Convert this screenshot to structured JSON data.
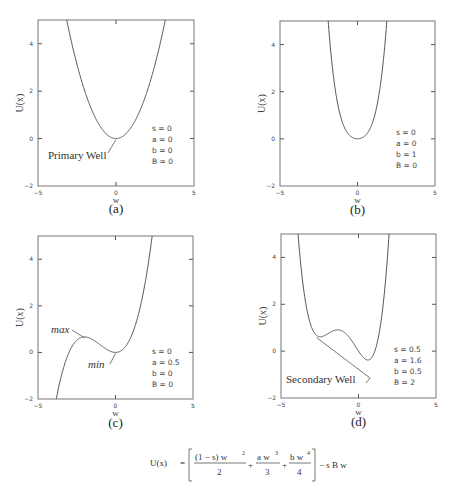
{
  "chart_data": [
    {
      "type": "line",
      "panel_label": "(a)",
      "xlabel": "w",
      "ylabel": "U(x)",
      "xlim": [
        -5,
        5
      ],
      "ylim": [
        -2,
        5
      ],
      "x_ticks": [
        "-5",
        "0",
        "5"
      ],
      "y_ticks": [
        "-2",
        "0",
        "2",
        "4"
      ],
      "params": [
        "s = 0",
        "a = 0",
        "b = 0",
        "B = 0"
      ],
      "param_values": {
        "s": 0,
        "a": 0,
        "b": 0,
        "B": 0
      },
      "annotations": [
        {
          "text": "Primary Well",
          "style": "normal",
          "points_to": [
            0,
            0
          ]
        }
      ],
      "series": [
        {
          "name": "U(w)",
          "x": [
            -3.16,
            -3,
            -2.5,
            -2,
            -1.5,
            -1,
            -0.5,
            0,
            0.5,
            1,
            1.5,
            2,
            2.5,
            3,
            3.16
          ],
          "y": [
            5.0,
            4.5,
            3.125,
            2.0,
            1.125,
            0.5,
            0.125,
            0,
            0.125,
            0.5,
            1.125,
            2.0,
            3.125,
            4.5,
            5.0
          ]
        }
      ]
    },
    {
      "type": "line",
      "panel_label": "(b)",
      "xlabel": "w",
      "ylabel": "U(x)",
      "xlim": [
        -5,
        5
      ],
      "ylim": [
        -2,
        5
      ],
      "x_ticks": [
        "-5",
        "0",
        "5"
      ],
      "y_ticks": [
        "-2",
        "0",
        "2",
        "4"
      ],
      "params": [
        "s = 0",
        "a = 0",
        "b = 1",
        "B = 0"
      ],
      "param_values": {
        "s": 0,
        "a": 0,
        "b": 1,
        "B": 0
      },
      "annotations": [],
      "series": [
        {
          "name": "U(w)",
          "x": [
            -1.85,
            -1.5,
            -1,
            -0.5,
            0,
            0.5,
            1,
            1.5,
            1.85
          ],
          "y": [
            5.0,
            2.39,
            0.75,
            0.14,
            0,
            0.14,
            0.75,
            2.39,
            5.0
          ]
        }
      ]
    },
    {
      "type": "line",
      "panel_label": "(c)",
      "xlabel": "w",
      "ylabel": "U(x)",
      "xlim": [
        -5,
        5
      ],
      "ylim": [
        -2,
        5
      ],
      "x_ticks": [
        "-5",
        "0",
        "5"
      ],
      "y_ticks": [
        "-2",
        "0",
        "2",
        "4"
      ],
      "params": [
        "s = 0",
        "a = 0.5",
        "b = 0",
        "B = 0"
      ],
      "param_values": {
        "s": 0,
        "a": 0.5,
        "b": 0,
        "B": 0
      },
      "annotations": [
        {
          "text": "max",
          "style": "italic",
          "points_to": [
            -2,
            0.67
          ]
        },
        {
          "text": "min",
          "style": "italic",
          "points_to": [
            0,
            0
          ]
        }
      ],
      "series": [
        {
          "name": "U(w)",
          "x": [
            -4.1,
            -3.5,
            -3,
            -2.5,
            -2,
            -1.5,
            -1,
            -0.5,
            0,
            0.5,
            1,
            1.5,
            2,
            2.5,
            2.65
          ],
          "y": [
            -3.08,
            -1.02,
            0,
            0.52,
            0.67,
            0.56,
            0.33,
            0.1,
            0,
            0.15,
            0.67,
            1.69,
            3.33,
            5.73,
            5.0
          ]
        }
      ]
    },
    {
      "type": "line",
      "panel_label": "(d)",
      "xlabel": "w",
      "ylabel": "U(x)",
      "xlim": [
        -5,
        5
      ],
      "ylim": [
        -2,
        5
      ],
      "x_ticks": [
        "-5",
        "0",
        "5"
      ],
      "y_ticks": [
        "-2",
        "0",
        "2",
        "4"
      ],
      "params": [
        "s = 0.5",
        "a = 1.6",
        "b = 0.5",
        "B = 2"
      ],
      "param_values": {
        "s": 0.5,
        "a": 1.6,
        "b": 0.5,
        "B": 2
      },
      "annotations": [
        {
          "text": "Secondary Well",
          "style": "normal",
          "points_to": [
            -2.7,
            0.66
          ]
        }
      ],
      "series": [
        {
          "name": "U(w)",
          "x": [
            -4.1,
            -3.5,
            -3,
            -2.7,
            -2.5,
            -2,
            -1.5,
            -1,
            -0.5,
            0,
            0.5,
            0.65,
            1,
            1.5,
            1.95
          ],
          "y": [
            4.9,
            1.4,
            0.76,
            0.66,
            0.68,
            0.87,
            0.87,
            0.84,
            0.5,
            0,
            -0.37,
            -0.38,
            -0.12,
            1.36,
            5.0
          ]
        }
      ]
    }
  ],
  "formula": {
    "lhs": "U(x)",
    "equals": "=",
    "term1_num": "(1 − s) w",
    "term1_exp": "2",
    "term1_den": "2",
    "plus1": "+",
    "term2_num": "a w",
    "term2_exp": "3",
    "term2_den": "3",
    "plus2": "+",
    "term3_num": "b w",
    "term3_exp": "4",
    "term3_den": "4",
    "tail": "− s B w"
  }
}
